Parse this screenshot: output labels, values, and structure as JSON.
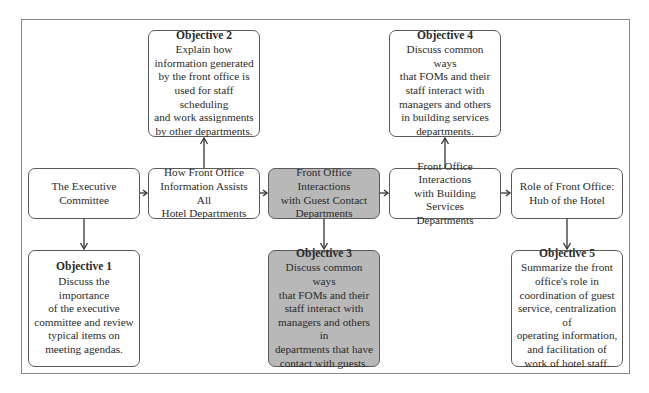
{
  "diagram": {
    "topics": [
      {
        "id": "t1",
        "label": "The Executive\nCommittee",
        "highlighted": false
      },
      {
        "id": "t2",
        "label": "How Front Office\nInformation Assists All\nHotel Departments",
        "highlighted": false
      },
      {
        "id": "t3",
        "label": "Front Office Interactions\nwith Guest Contact\nDepartments",
        "highlighted": true
      },
      {
        "id": "t4",
        "label": "Front Office Interactions\nwith Building Services\nDepartments",
        "highlighted": false
      },
      {
        "id": "t5",
        "label": "Role of Front Office:\nHub of the Hotel",
        "highlighted": false
      }
    ],
    "objectives": [
      {
        "id": "o1",
        "title": "Objective 1",
        "text": "Discuss the importance\nof the executive\ncommittee and review\ntypical items on\nmeeting agendas.",
        "position": "below",
        "topic": "t1",
        "highlighted": false
      },
      {
        "id": "o2",
        "title": "Objective 2",
        "text": "Explain how\ninformation generated\nby the front office is\nused for staff scheduling\nand work assignments\nby other departments.",
        "position": "above",
        "topic": "t2",
        "highlighted": false
      },
      {
        "id": "o3",
        "title": "Objective 3",
        "text": "Discuss common ways\nthat FOMs and their\nstaff interact with\nmanagers and others in\ndepartments that have\ncontact with guests.",
        "position": "below",
        "topic": "t3",
        "highlighted": true
      },
      {
        "id": "o4",
        "title": "Objective 4",
        "text": "Discuss common ways\nthat FOMs and their\nstaff interact with\nmanagers and others\nin building services\ndepartments.",
        "position": "above",
        "topic": "t4",
        "highlighted": false
      },
      {
        "id": "o5",
        "title": "Objective 5",
        "text": "Summarize the front\noffice's role in\ncoordination of guest\nservice, centralization of\noperating information,\nand facilitation of\nwork of hotel staff.",
        "position": "below",
        "topic": "t5",
        "highlighted": false
      }
    ],
    "connections": [
      {
        "from": "t1",
        "to": "t2"
      },
      {
        "from": "t2",
        "to": "t3"
      },
      {
        "from": "t3",
        "to": "t4"
      },
      {
        "from": "t4",
        "to": "t5"
      },
      {
        "from": "t1",
        "to": "o1"
      },
      {
        "from": "t2",
        "to": "o2"
      },
      {
        "from": "t3",
        "to": "o3"
      },
      {
        "from": "t4",
        "to": "o4"
      },
      {
        "from": "t5",
        "to": "o5"
      }
    ],
    "colors": {
      "highlight_fill": "#b8b8b8",
      "box_border": "#5a5a5a",
      "frame_border": "#8a8a8a",
      "arrow": "#333333"
    }
  }
}
